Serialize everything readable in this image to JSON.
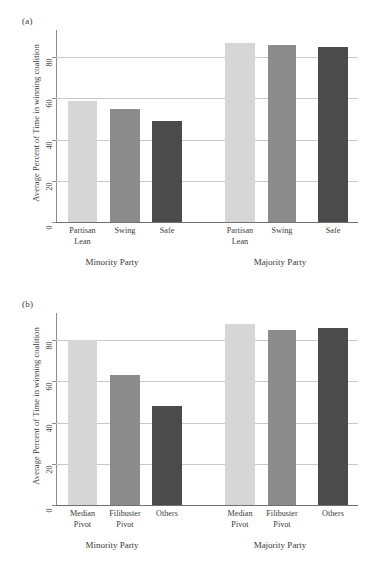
{
  "figure": {
    "ylabel": "Average Percent of Time in winning coalition",
    "panel_a_letter": "(a)",
    "panel_b_letter": "(b)"
  },
  "chart_data": [
    {
      "type": "bar",
      "panel": "(a)",
      "title": "",
      "xlabel": "",
      "ylabel": "Average Percent of Time in winning coalition",
      "ylim": [
        0,
        100
      ],
      "yticks": [
        0,
        20,
        40,
        60,
        80
      ],
      "ytick_labels": [
        "0",
        "20",
        "40",
        "60",
        "80"
      ],
      "grid": true,
      "legend": "none",
      "groups": [
        "Minority Party",
        "Majority Party"
      ],
      "categories": [
        "Partisan\nLean",
        "Swing",
        "Safe"
      ],
      "series": [
        {
          "name": "Minority Party",
          "values": [
            58.5,
            55,
            49
          ]
        },
        {
          "name": "Majority Party",
          "values": [
            87,
            86,
            85
          ]
        }
      ],
      "colors": [
        "#d6d6d6",
        "#8c8c8c",
        "#4b4b4b"
      ]
    },
    {
      "type": "bar",
      "panel": "(b)",
      "title": "",
      "xlabel": "",
      "ylabel": "Average Percent of Time in winning coalition",
      "ylim": [
        0,
        100
      ],
      "yticks": [
        0,
        20,
        40,
        60,
        80
      ],
      "ytick_labels": [
        "0",
        "20",
        "40",
        "60",
        "80"
      ],
      "grid": true,
      "legend": "none",
      "groups": [
        "Minority Party",
        "Majority Party"
      ],
      "categories": [
        "Median\nPivot",
        "Filibuster\nPivot",
        "Others"
      ],
      "series": [
        {
          "name": "Minority Party",
          "values": [
            80,
            63,
            48
          ]
        },
        {
          "name": "Majority Party",
          "values": [
            88,
            85,
            86
          ]
        }
      ],
      "colors": [
        "#d6d6d6",
        "#8c8c8c",
        "#4b4b4b"
      ]
    }
  ],
  "panel_a": {
    "letter": "(a)",
    "ylabel": "Average Percent of Time in winning coalition",
    "ytick_labels": [
      "0",
      "20",
      "40",
      "60",
      "80"
    ],
    "bars": [
      {
        "label": "Partisan\nLean",
        "value": 58.5,
        "group": "Minority Party",
        "color": "#d6d6d6"
      },
      {
        "label": "Swing",
        "value": 55,
        "group": "Minority Party",
        "color": "#8c8c8c"
      },
      {
        "label": "Safe",
        "value": 49,
        "group": "Minority Party",
        "color": "#4b4b4b"
      },
      {
        "label": "Partisan\nLean",
        "value": 87,
        "group": "Majority Party",
        "color": "#d6d6d6"
      },
      {
        "label": "Swing",
        "value": 86,
        "group": "Majority Party",
        "color": "#8c8c8c"
      },
      {
        "label": "Safe",
        "value": 85,
        "group": "Majority Party",
        "color": "#4b4b4b"
      }
    ],
    "group_labels": [
      "Minority Party",
      "Majority Party"
    ]
  },
  "panel_b": {
    "letter": "(b)",
    "ylabel": "Average Percent of Time in winning coalition",
    "ytick_labels": [
      "0",
      "20",
      "40",
      "60",
      "80"
    ],
    "bars": [
      {
        "label": "Median\nPivot",
        "value": 80,
        "group": "Minority Party",
        "color": "#d6d6d6"
      },
      {
        "label": "Filibuster\nPivot",
        "value": 63,
        "group": "Minority Party",
        "color": "#8c8c8c"
      },
      {
        "label": "Others",
        "value": 48,
        "group": "Minority Party",
        "color": "#4b4b4b"
      },
      {
        "label": "Median\nPivot",
        "value": 88,
        "group": "Majority Party",
        "color": "#d6d6d6"
      },
      {
        "label": "Filibuster\nPivot",
        "value": 85,
        "group": "Majority Party",
        "color": "#8c8c8c"
      },
      {
        "label": "Others",
        "value": 86,
        "group": "Majority Party",
        "color": "#4b4b4b"
      }
    ],
    "group_labels": [
      "Minority Party",
      "Majority Party"
    ]
  }
}
